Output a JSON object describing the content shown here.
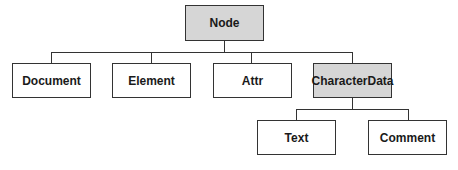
{
  "diagram": {
    "type": "class-hierarchy-tree",
    "root": {
      "label": "Node",
      "shaded": true
    },
    "level1": [
      {
        "label": "Document",
        "shaded": false
      },
      {
        "label": "Element",
        "shaded": false
      },
      {
        "label": "Attr",
        "shaded": false
      },
      {
        "label": "CharacterData",
        "shaded": true
      }
    ],
    "level2": [
      {
        "label": "Text",
        "shaded": false,
        "parent": "CharacterData"
      },
      {
        "label": "Comment",
        "shaded": false,
        "parent": "CharacterData"
      }
    ],
    "colors": {
      "shaded_fill": "#d6d6d6",
      "border": "#333333",
      "background": "#ffffff"
    }
  }
}
